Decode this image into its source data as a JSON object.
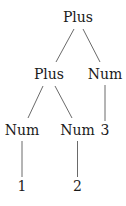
{
  "diagram": {
    "type": "tree",
    "nodes": [
      {
        "id": "n0",
        "label": "Plus"
      },
      {
        "id": "n1",
        "label": "Plus"
      },
      {
        "id": "n2",
        "label": "Num"
      },
      {
        "id": "n3",
        "label": "Num"
      },
      {
        "id": "n4",
        "label": "Num"
      },
      {
        "id": "n5",
        "label": "3"
      },
      {
        "id": "n6",
        "label": "1"
      },
      {
        "id": "n7",
        "label": "2"
      }
    ],
    "edges": [
      {
        "from": "n0",
        "to": "n1"
      },
      {
        "from": "n0",
        "to": "n2"
      },
      {
        "from": "n1",
        "to": "n3"
      },
      {
        "from": "n1",
        "to": "n4"
      },
      {
        "from": "n2",
        "to": "n5"
      },
      {
        "from": "n3",
        "to": "n6"
      },
      {
        "from": "n4",
        "to": "n7"
      }
    ],
    "colors": {
      "text": "#1a1a1a",
      "edge": "#444444",
      "background": "#ffffff"
    }
  }
}
